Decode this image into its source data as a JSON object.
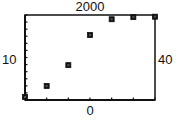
{
  "chart_data": {
    "type": "scatter",
    "title": "",
    "xlabel": "",
    "ylabel": "",
    "window_labels": {
      "top": "2000",
      "bottom": "0",
      "left": "10",
      "right": "40"
    },
    "xlim": [
      10,
      40
    ],
    "ylim": [
      0,
      2000
    ],
    "grid": false,
    "legend": null,
    "marker": "square",
    "x_ticks_count": 7,
    "y_ticks_count": 12,
    "x": [
      10,
      15,
      20,
      25,
      30,
      35,
      40
    ],
    "values": [
      70,
      330,
      820,
      1530,
      1900,
      1950,
      1960
    ],
    "series": [
      {
        "name": "data",
        "points": [
          {
            "x": 10,
            "y": 70
          },
          {
            "x": 15,
            "y": 330
          },
          {
            "x": 20,
            "y": 820
          },
          {
            "x": 25,
            "y": 1530
          },
          {
            "x": 30,
            "y": 1900
          },
          {
            "x": 35,
            "y": 1950
          },
          {
            "x": 40,
            "y": 1960
          }
        ]
      }
    ]
  },
  "colors": {
    "axis": "#111111",
    "marker": "#111111",
    "background": "#ffffff"
  }
}
